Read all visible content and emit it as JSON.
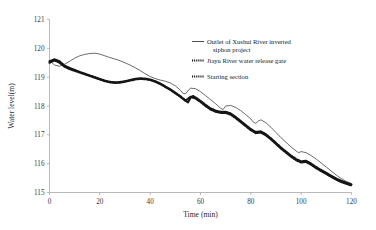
{
  "chart_data": {
    "type": "line",
    "title": "",
    "xlabel": "Time (min)",
    "ylabel": "Water level(m)",
    "xlim": [
      0,
      120
    ],
    "ylim": [
      115,
      121
    ],
    "xticks": [
      0,
      20,
      40,
      60,
      80,
      100,
      120
    ],
    "yticks": [
      115,
      116,
      117,
      118,
      119,
      120,
      121
    ],
    "grid": false,
    "legend_position": "upper-right-outside",
    "series": [
      {
        "name": "Outlet of Xushui River inverted siphon project",
        "style": "thin-solid-line",
        "color": "#3a3a3a",
        "x": [
          0,
          2,
          4,
          6,
          8,
          10,
          12,
          14,
          16,
          18,
          20,
          22,
          24,
          26,
          28,
          30,
          32,
          34,
          36,
          38,
          40,
          42,
          44,
          46,
          48,
          50,
          52,
          53,
          54,
          55,
          56,
          58,
          60,
          62,
          64,
          66,
          67,
          68,
          69,
          70,
          72,
          74,
          76,
          78,
          80,
          81,
          82,
          83,
          84,
          86,
          88,
          90,
          92,
          94,
          96,
          98,
          99,
          100,
          102,
          104,
          106,
          108,
          110,
          112,
          114,
          116,
          118,
          120
        ],
        "y": [
          119.58,
          119.42,
          119.38,
          119.45,
          119.55,
          119.66,
          119.74,
          119.79,
          119.82,
          119.83,
          119.8,
          119.74,
          119.68,
          119.63,
          119.57,
          119.5,
          119.42,
          119.33,
          119.23,
          119.12,
          119.02,
          118.95,
          118.9,
          118.86,
          118.8,
          118.7,
          118.55,
          118.44,
          118.42,
          118.52,
          118.62,
          118.6,
          118.5,
          118.36,
          118.22,
          118.08,
          118.0,
          117.92,
          117.88,
          118.0,
          118.02,
          117.95,
          117.84,
          117.7,
          117.55,
          117.44,
          117.4,
          117.48,
          117.52,
          117.42,
          117.26,
          117.08,
          116.9,
          116.74,
          116.58,
          116.44,
          116.38,
          116.42,
          116.38,
          116.28,
          116.16,
          116.02,
          115.88,
          115.74,
          115.6,
          115.48,
          115.38,
          115.3
        ]
      },
      {
        "name": "Jiayu River water release gate",
        "style": "dotted-thick-line",
        "color": "#151515",
        "x": [
          0,
          2,
          4,
          6,
          8,
          10,
          12,
          14,
          16,
          18,
          20,
          22,
          24,
          26,
          28,
          30,
          32,
          34,
          36,
          38,
          40,
          42,
          44,
          46,
          48,
          50,
          52,
          54,
          55,
          56,
          57,
          58,
          60,
          62,
          64,
          66,
          68,
          70,
          72,
          74,
          76,
          78,
          80,
          82,
          84,
          86,
          88,
          90,
          92,
          94,
          96,
          98,
          100,
          102,
          104,
          106,
          108,
          110,
          112,
          114,
          116,
          118,
          120
        ],
        "y": [
          119.55,
          119.62,
          119.55,
          119.4,
          119.32,
          119.25,
          119.18,
          119.12,
          119.06,
          119.0,
          118.94,
          118.88,
          118.84,
          118.82,
          118.83,
          118.86,
          118.9,
          118.94,
          118.96,
          118.95,
          118.92,
          118.86,
          118.78,
          118.68,
          118.58,
          118.46,
          118.34,
          118.2,
          118.12,
          118.28,
          118.35,
          118.3,
          118.18,
          118.04,
          117.92,
          117.84,
          117.8,
          117.8,
          117.74,
          117.62,
          117.48,
          117.34,
          117.2,
          117.1,
          117.12,
          117.02,
          116.88,
          116.72,
          116.56,
          116.42,
          116.28,
          116.16,
          116.08,
          116.1,
          116.0,
          115.88,
          115.78,
          115.68,
          115.58,
          115.48,
          115.4,
          115.34,
          115.28
        ]
      },
      {
        "name": "Starting section",
        "style": "dotted-thick-line",
        "color": "#151515",
        "x": [
          0,
          2,
          4,
          6,
          8,
          10,
          12,
          14,
          16,
          18,
          20,
          22,
          24,
          26,
          28,
          30,
          32,
          34,
          36,
          38,
          40,
          42,
          44,
          46,
          48,
          50,
          52,
          54,
          56,
          58,
          60,
          62,
          64,
          66,
          68,
          70,
          72,
          74,
          76,
          78,
          80,
          82,
          84,
          86,
          88,
          90,
          92,
          94,
          96,
          98,
          100,
          102,
          104,
          106,
          108,
          110,
          112,
          114,
          116,
          118,
          120
        ],
        "y": [
          119.5,
          119.58,
          119.5,
          119.36,
          119.28,
          119.22,
          119.16,
          119.1,
          119.04,
          118.98,
          118.92,
          118.86,
          118.82,
          118.8,
          118.81,
          118.84,
          118.88,
          118.92,
          118.94,
          118.93,
          118.9,
          118.84,
          118.76,
          118.66,
          118.56,
          118.44,
          118.32,
          118.18,
          118.32,
          118.26,
          118.14,
          118.0,
          117.88,
          117.8,
          117.76,
          117.76,
          117.7,
          117.58,
          117.44,
          117.3,
          117.16,
          117.06,
          117.08,
          116.98,
          116.84,
          116.68,
          116.52,
          116.38,
          116.24,
          116.12,
          116.04,
          116.06,
          115.96,
          115.84,
          115.74,
          115.64,
          115.54,
          115.44,
          115.36,
          115.3,
          115.24
        ]
      }
    ]
  },
  "legend": {
    "items": [
      {
        "label": "Outlet of Xushui River inverted",
        "label2": "siphon project",
        "style": "line"
      },
      {
        "label": "Jiayu River water release gate",
        "label2": "",
        "style": "dot"
      },
      {
        "label": "Starting section",
        "label2": "",
        "style": "dot"
      }
    ]
  }
}
